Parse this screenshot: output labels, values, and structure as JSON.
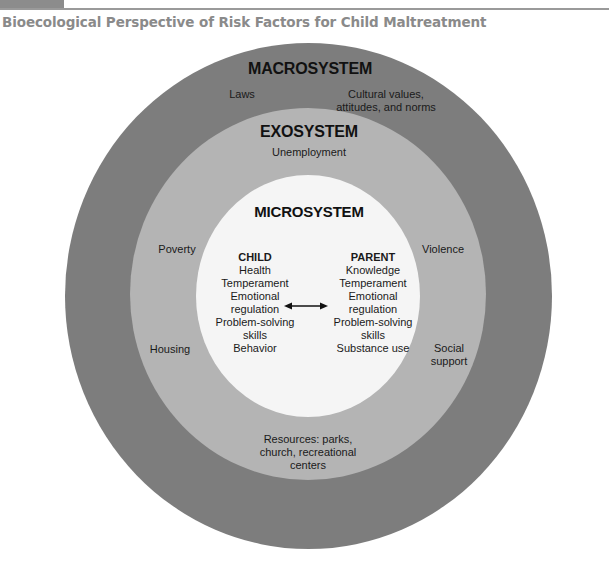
{
  "figure": {
    "title": "Bioecological Perspective of Risk Factors for Child Maltreatment"
  },
  "colors": {
    "macrosystem": "#7d7d7d",
    "exosystem": "#b4b4b4",
    "microsystem": "#f5f5f5",
    "title_text": "#8a8a8a"
  },
  "macrosystem": {
    "heading": "MACROSYSTEM",
    "factors": {
      "laws": "Laws",
      "cultural_line1": "Cultural values,",
      "cultural_line2": "attitudes, and norms"
    }
  },
  "exosystem": {
    "heading": "EXOSYSTEM",
    "factors": {
      "unemployment": "Unemployment",
      "poverty": "Poverty",
      "housing": "Housing",
      "violence": "Violence",
      "social_line1": "Social",
      "social_line2": "support",
      "resources_line1": "Resources: parks,",
      "resources_line2": "church, recreational",
      "resources_line3": "centers"
    }
  },
  "microsystem": {
    "heading": "MICROSYSTEM",
    "child": {
      "heading": "CHILD",
      "lines": [
        "Health",
        "Temperament",
        "Emotional",
        "regulation",
        "Problem-solving",
        "skills",
        "Behavior"
      ]
    },
    "parent": {
      "heading": "PARENT",
      "lines": [
        "Knowledge",
        "Temperament",
        "Emotional",
        "regulation",
        "Problem-solving",
        "skills",
        "Substance use"
      ]
    },
    "relation_icon": "double-headed-arrow"
  }
}
